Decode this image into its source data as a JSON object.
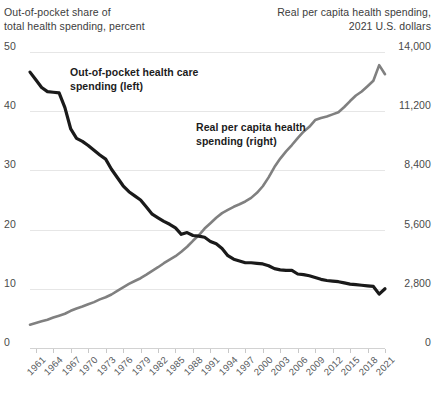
{
  "chart_data": {
    "type": "line",
    "title": "",
    "left_axis": {
      "label": "Out-of-pocket share of\ntotal health spending, percent",
      "ticks": [
        "0",
        "10",
        "20",
        "30",
        "40",
        "50"
      ],
      "tick_values": [
        0,
        10,
        20,
        30,
        40,
        50
      ],
      "ylim": [
        0,
        50
      ]
    },
    "right_axis": {
      "label": "Real per capita health spending,\n2021 U.S. dollars",
      "ticks": [
        "0",
        "2,800",
        "5,600",
        "8,400",
        "11,200",
        "14,000"
      ],
      "tick_values": [
        0,
        2800,
        5600,
        8400,
        11200,
        14000
      ],
      "ylim": [
        0,
        14000
      ]
    },
    "xlabel": "",
    "xlim": [
      1960,
      2021
    ],
    "grid": true,
    "legend_position": "inline-annotations",
    "tick_labels_x": [
      "1961",
      "1964",
      "1967",
      "1970",
      "1973",
      "1976",
      "1979",
      "1982",
      "1985",
      "1988",
      "1991",
      "1994",
      "1997",
      "2000",
      "2003",
      "2006",
      "2009",
      "2012",
      "2015",
      "2018",
      "2021"
    ],
    "annotations": [
      {
        "name": "out-of-pocket-annotation",
        "text": "Out-of-pocket health care\nspending (left)"
      },
      {
        "name": "real-spending-annotation",
        "text": "Real per capita health\nspending (right)"
      }
    ],
    "series": [
      {
        "name": "Out-of-pocket health care spending (left)",
        "axis": "left",
        "color": "#1a1a1a",
        "x": [
          1960,
          1961,
          1962,
          1963,
          1964,
          1965,
          1966,
          1967,
          1968,
          1969,
          1970,
          1971,
          1972,
          1973,
          1974,
          1975,
          1976,
          1977,
          1978,
          1979,
          1980,
          1981,
          1982,
          1983,
          1984,
          1985,
          1986,
          1987,
          1988,
          1989,
          1990,
          1991,
          1992,
          1993,
          1994,
          1995,
          1996,
          1997,
          1998,
          1999,
          2000,
          2001,
          2002,
          2003,
          2004,
          2005,
          2006,
          2007,
          2008,
          2009,
          2010,
          2011,
          2012,
          2013,
          2014,
          2015,
          2016,
          2017,
          2018,
          2019,
          2020,
          2021
        ],
        "values": [
          46.6,
          45.3,
          44.0,
          43.3,
          43.2,
          43.1,
          40.6,
          37.0,
          35.4,
          34.9,
          34.2,
          33.4,
          32.6,
          31.9,
          30.2,
          28.8,
          27.4,
          26.4,
          25.7,
          25.0,
          23.8,
          22.6,
          22.0,
          21.4,
          20.9,
          20.3,
          19.2,
          19.5,
          19.0,
          18.9,
          18.7,
          18.0,
          17.6,
          16.8,
          15.6,
          15.0,
          14.7,
          14.4,
          14.4,
          14.3,
          14.2,
          13.9,
          13.4,
          13.2,
          13.1,
          13.1,
          12.5,
          12.4,
          12.2,
          11.9,
          11.6,
          11.4,
          11.3,
          11.2,
          11.0,
          10.8,
          10.7,
          10.6,
          10.5,
          10.4,
          9.1,
          10.0
        ],
        "start_value": 46.6,
        "end_value": 10.0,
        "min_value": 9.1,
        "max_value": 46.6
      },
      {
        "name": "Real per capita health spending (right)",
        "axis": "right",
        "color": "#808080",
        "x": [
          1960,
          1961,
          1962,
          1963,
          1964,
          1965,
          1966,
          1967,
          1968,
          1969,
          1970,
          1971,
          1972,
          1973,
          1974,
          1975,
          1976,
          1977,
          1978,
          1979,
          1980,
          1981,
          1982,
          1983,
          1984,
          1985,
          1986,
          1987,
          1988,
          1989,
          1990,
          1991,
          1992,
          1993,
          1994,
          1995,
          1996,
          1997,
          1998,
          1999,
          2000,
          2001,
          2002,
          2003,
          2004,
          2005,
          2006,
          2007,
          2008,
          2009,
          2010,
          2011,
          2012,
          2013,
          2014,
          2015,
          2016,
          2017,
          2018,
          2019,
          2020,
          2021
        ],
        "values": [
          1100,
          1180,
          1260,
          1340,
          1440,
          1530,
          1620,
          1760,
          1870,
          1960,
          2070,
          2170,
          2300,
          2400,
          2530,
          2700,
          2870,
          3030,
          3170,
          3300,
          3470,
          3650,
          3820,
          4010,
          4180,
          4340,
          4550,
          4790,
          5070,
          5330,
          5650,
          5900,
          6160,
          6380,
          6530,
          6680,
          6800,
          6930,
          7100,
          7340,
          7650,
          8070,
          8560,
          8960,
          9300,
          9600,
          9930,
          10230,
          10460,
          10780,
          10880,
          10950,
          11050,
          11150,
          11400,
          11680,
          11940,
          12130,
          12380,
          12640,
          13380,
          12950
        ],
        "start_value": 1100,
        "end_value": 12950,
        "min_value": 1100,
        "max_value": 13380
      }
    ]
  },
  "colors": {
    "black_series": "#1a1a1a",
    "gray_series": "#808080",
    "gridline": "#e6e6e6",
    "text": "#3c3c3c",
    "background": "#ffffff"
  }
}
